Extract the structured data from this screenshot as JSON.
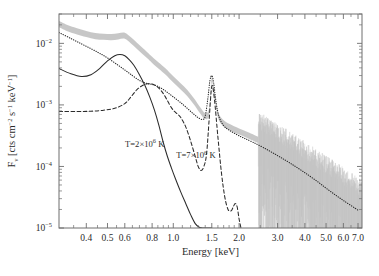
{
  "chart_data": {
    "type": "line",
    "title": "",
    "xlabel": "Energy [keV]",
    "ylabel": "F_nu [cts cm^-2 s^-1 keV^-1]",
    "ylabel_parts": {
      "symbol": "F",
      "subscript": "ν",
      "unit_open": " [cts cm",
      "exp1": "−2",
      "mid1": " s",
      "exp2": "−1",
      "mid2": " keV",
      "exp3": "−1",
      "unit_close": "]"
    },
    "xscale": "log",
    "yscale": "log",
    "xlim": [
      0.3,
      7.3
    ],
    "ylim": [
      1e-05,
      0.03
    ],
    "grid": false,
    "legend_position": "none",
    "xticks": [
      0.4,
      0.5,
      0.6,
      0.8,
      1.0,
      1.5,
      2.0,
      3.0,
      4.0,
      5.0,
      6.0,
      7.0
    ],
    "xticklabels": [
      "0.4",
      "0.5",
      "0.6",
      "0.8",
      "1.0",
      "1.5",
      "2.0",
      "3.0",
      "4.0",
      "5.0",
      "6.0",
      "7.0"
    ],
    "yticks": [
      0.01,
      0.001,
      0.0001,
      1e-05
    ],
    "yticklabels": [
      "10⁻²",
      "10⁻³",
      "10⁻⁴",
      "10⁻⁵"
    ],
    "ytick_mantissa": "10",
    "ytick_exponents": [
      "−2",
      "−3",
      "−4",
      "−5"
    ],
    "annotations": [
      {
        "id": "cool-component-label",
        "text_plain": "T=2×10⁶ K",
        "prefix": "T=2×10",
        "exponent": "6",
        "suffix": " K",
        "x": 0.74,
        "y": 0.00021
      },
      {
        "id": "hot-component-label",
        "text_plain": "T=7×10⁶ K",
        "prefix": "T=7×10",
        "exponent": "6",
        "suffix": " K",
        "x": 1.27,
        "y": 0.000135
      }
    ],
    "series": [
      {
        "name": "observed-spectrum-band",
        "style": "band",
        "color": "#c4c4c4",
        "description": "Observed data with noise, thick grey band",
        "x": [
          0.3,
          0.33,
          0.36,
          0.4,
          0.44,
          0.48,
          0.52,
          0.56,
          0.6,
          0.64,
          0.68,
          0.72,
          0.76,
          0.8,
          0.86,
          0.92,
          1.0,
          1.08,
          1.16,
          1.24,
          1.32,
          1.4,
          1.46,
          1.5,
          1.54,
          1.6,
          1.7,
          1.85,
          2.0,
          2.2,
          2.45
        ],
        "values": [
          0.0205,
          0.0175,
          0.0158,
          0.0142,
          0.0131,
          0.0128,
          0.0126,
          0.013,
          0.0133,
          0.0112,
          0.0092,
          0.0076,
          0.0064,
          0.0054,
          0.0043,
          0.0035,
          0.0026,
          0.002,
          0.00155,
          0.00115,
          0.00084,
          0.00066,
          0.0008,
          0.0026,
          0.0016,
          0.0007,
          0.0005,
          0.00042,
          0.00037,
          0.00032,
          0.00027
        ],
        "band_halfwidth_dex": 0.05
      },
      {
        "name": "total-model-dotted",
        "style": "dotted",
        "color": "#2b2b2b",
        "description": "Two-temperature total model fit",
        "x": [
          0.3,
          0.34,
          0.38,
          0.42,
          0.46,
          0.5,
          0.55,
          0.6,
          0.65,
          0.7,
          0.75,
          0.8,
          0.85,
          0.9,
          0.95,
          1.0,
          1.06,
          1.12,
          1.18,
          1.24,
          1.3,
          1.36,
          1.4,
          1.44,
          1.47,
          1.5,
          1.53,
          1.57,
          1.62,
          1.7,
          1.8,
          1.95,
          2.1,
          2.3,
          2.6,
          3.0,
          3.4,
          3.9,
          4.5,
          5.2,
          6.0,
          7.0
        ],
        "values": [
          0.015,
          0.012,
          0.0098,
          0.0082,
          0.0069,
          0.0058,
          0.0046,
          0.0037,
          0.003,
          0.0025,
          0.00225,
          0.00215,
          0.002,
          0.00178,
          0.00155,
          0.00135,
          0.00115,
          0.00098,
          0.00083,
          0.00071,
          0.00062,
          0.00058,
          0.00066,
          0.0013,
          0.00245,
          0.003,
          0.0023,
          0.0011,
          0.00064,
          0.00046,
          0.00039,
          0.00033,
          0.00029,
          0.00025,
          0.0002,
          0.00015,
          0.000115,
          8.4e-05,
          5.9e-05,
          4e-05,
          2.8e-05,
          1.95e-05
        ]
      },
      {
        "name": "cool-component-solid",
        "style": "solid",
        "color": "#2b2b2b",
        "description": "T=2x10^6 K component",
        "temperature_K": 2000000,
        "x": [
          0.3,
          0.34,
          0.38,
          0.42,
          0.46,
          0.5,
          0.54,
          0.57,
          0.6,
          0.63,
          0.66,
          0.7,
          0.74,
          0.78,
          0.82,
          0.86,
          0.9,
          0.94,
          0.98,
          1.02,
          1.08,
          1.14,
          1.2,
          1.26,
          1.32,
          1.38,
          1.42,
          1.46,
          1.5
        ],
        "values": [
          0.0039,
          0.0032,
          0.0029,
          0.0031,
          0.0039,
          0.0052,
          0.0063,
          0.0066,
          0.0063,
          0.0054,
          0.0044,
          0.0031,
          0.0021,
          0.00135,
          0.00082,
          0.00046,
          0.000245,
          0.000145,
          9.5e-05,
          6.5e-05,
          3.9e-05,
          2.5e-05,
          1.65e-05,
          1.18e-05,
          1.02e-05,
          1e-05,
          1e-05,
          1e-05,
          1e-05
        ]
      },
      {
        "name": "hot-component-dashed",
        "style": "dashed",
        "color": "#2b2b2b",
        "description": "T=7x10^6 K component",
        "temperature_K": 7000000,
        "x": [
          0.3,
          0.36,
          0.42,
          0.48,
          0.54,
          0.6,
          0.64,
          0.68,
          0.72,
          0.76,
          0.8,
          0.84,
          0.88,
          0.92,
          0.96,
          1.0,
          1.04,
          1.08,
          1.14,
          1.2,
          1.26,
          1.3,
          1.34,
          1.38,
          1.42,
          1.46,
          1.5,
          1.54,
          1.6,
          1.66,
          1.72,
          1.78,
          1.84,
          1.88,
          1.92,
          1.96,
          2.0,
          2.04
        ],
        "values": [
          0.00078,
          0.00078,
          0.00079,
          0.00082,
          0.00088,
          0.00105,
          0.00135,
          0.00175,
          0.00205,
          0.0022,
          0.00218,
          0.002,
          0.0017,
          0.00135,
          0.00102,
          0.00082,
          0.00072,
          0.00063,
          0.00044,
          0.00026,
          0.000145,
          0.0001,
          8.6e-05,
          0.0001,
          0.00016,
          0.0006,
          0.002,
          0.0013,
          0.0003,
          8e-05,
          3.2e-05,
          2e-05,
          1.9e-05,
          2.2e-05,
          2.5e-05,
          2.2e-05,
          1.4e-05,
          1e-05
        ]
      }
    ]
  }
}
